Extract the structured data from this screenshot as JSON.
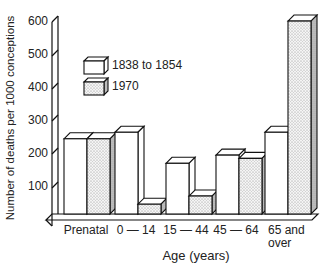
{
  "chart_data": {
    "type": "bar",
    "style": "3d-grouped",
    "title": "",
    "xlabel": "Age (years)",
    "ylabel": "Number of deaths per 1000 conceptions",
    "ylim": [
      0,
      600
    ],
    "yticks": [
      100,
      200,
      300,
      400,
      500,
      600
    ],
    "grid": false,
    "legend_position": "upper-left inside",
    "categories": [
      "Prenatal",
      "0 — 14",
      "15 — 44",
      "45 — 64",
      "65 and over"
    ],
    "series": [
      {
        "name": "1838 to 1854",
        "fill": "white",
        "values": [
          230,
          250,
          155,
          180,
          250
        ]
      },
      {
        "name": "1970",
        "fill": "stippled",
        "values": [
          230,
          30,
          55,
          170,
          590
        ]
      }
    ]
  },
  "axis": {
    "ylabel": "Number of deaths per 1000 conceptions",
    "xlabel": "Age (years)",
    "ticks": [
      "100",
      "200",
      "300",
      "400",
      "500",
      "600"
    ]
  },
  "legend": {
    "item1": "1838 to 1854",
    "item2": "1970"
  },
  "categories": {
    "c0": "Prenatal",
    "c1": "0 — 14",
    "c2": "15 — 44",
    "c3": "45 — 64",
    "c4a": "65 and",
    "c4b": "over"
  },
  "colors": {
    "stroke": "#111111",
    "side_shade": "#bdbdbd",
    "stipple": "#d9d9d9"
  }
}
